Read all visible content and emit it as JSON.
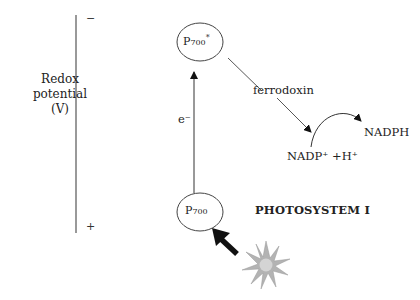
{
  "axis": {
    "label_line1": "Redox",
    "label_line2": "potential",
    "label_line3": "(V)",
    "top_sign": "−",
    "bottom_sign": "+"
  },
  "nodes": {
    "excited": {
      "base": "P",
      "sub": "700",
      "sup": "*"
    },
    "ground": {
      "base": "P",
      "sub": "700"
    }
  },
  "labels": {
    "electron": "e⁻",
    "ferrodoxin": "ferrodoxin",
    "nadp_reactant": "NADP⁺ +H⁺",
    "nadph": "NADPH",
    "photosystem": "PHOTOSYSTEM I"
  },
  "colors": {
    "line": "#333333",
    "arrow_fill": "#111111",
    "sun_fill": "#b8b8b8",
    "sun_center": "#d6d6d6"
  }
}
